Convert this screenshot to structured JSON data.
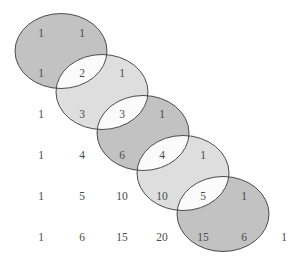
{
  "diagram": {
    "type": "pascal-triangle-overlapping-ellipses",
    "colors": {
      "dark_fill": "#c2c2c2",
      "light_fill": "#dedede",
      "overlap_fill": "#fbfbfb",
      "stroke": "#3a3a3a",
      "text": "#4a4a4a",
      "background": "#ffffff"
    },
    "ellipses": [
      {
        "cx": 61,
        "cy": 51,
        "rx": 46,
        "ry": 37.5,
        "shade": "dark"
      },
      {
        "cx": 102,
        "cy": 92,
        "rx": 46,
        "ry": 37.5,
        "shade": "light"
      },
      {
        "cx": 143,
        "cy": 133,
        "rx": 46,
        "ry": 37.5,
        "shade": "dark"
      },
      {
        "cx": 183,
        "cy": 173,
        "rx": 46,
        "ry": 37.5,
        "shade": "light"
      },
      {
        "cx": 223,
        "cy": 214,
        "rx": 46,
        "ry": 37.5,
        "shade": "dark"
      }
    ],
    "column_x": [
      41,
      82,
      122,
      162,
      203,
      244,
      284
    ],
    "rows": [
      {
        "y": 33,
        "values": [
          "1",
          "1"
        ]
      },
      {
        "y": 73,
        "values": [
          "1",
          "2",
          "1"
        ]
      },
      {
        "y": 114,
        "values": [
          "1",
          "3",
          "3",
          "1"
        ]
      },
      {
        "y": 155,
        "values": [
          "1",
          "4",
          "6",
          "4",
          "1"
        ]
      },
      {
        "y": 196,
        "values": [
          "1",
          "5",
          "10",
          "10",
          "5",
          "1"
        ]
      },
      {
        "y": 237,
        "values": [
          "1",
          "6",
          "15",
          "20",
          "15",
          "6",
          "1"
        ]
      }
    ]
  }
}
